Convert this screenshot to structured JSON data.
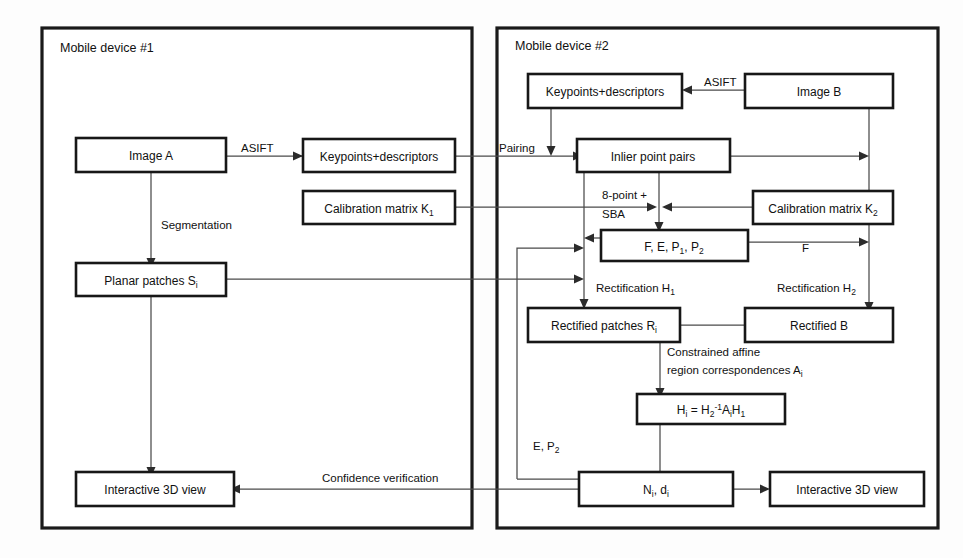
{
  "figure": {
    "type": "flowchart"
  },
  "panels": [
    {
      "id": "device1",
      "title": "Mobile device #1"
    },
    {
      "id": "device2",
      "title": "Mobile device #2"
    }
  ],
  "nodes": {
    "image_a": "Image A",
    "keypoints_a": "Keypoints+descriptors",
    "calib_k1_main": "Calibration matrix K",
    "calib_k1_sub": "1",
    "planar_patches_main": "Planar patches S",
    "planar_patches_sub": "i",
    "interactive_3d_left": "Interactive 3D view",
    "keypoints_b": "Keypoints+descriptors",
    "image_b": "Image B",
    "inlier_pairs": "Inlier point pairs",
    "calib_k2_main": "Calibration matrix K",
    "calib_k2_sub": "2",
    "fep_main_1": "F, E, P",
    "fep_sub_1": "1",
    "fep_main_2": ", P",
    "fep_sub_2": "2",
    "rectified_patches_main": "Rectified patches R",
    "rectified_patches_sub": "i",
    "rectified_b": "Rectified B",
    "homography_h_main": "H",
    "homography_h_sub": "i",
    "homography_eq": " = H",
    "homography_h2_sub": "2",
    "homography_h2_sup": "-1",
    "homography_a": "A",
    "homography_a_sub": "i",
    "homography_h1": "H",
    "homography_h1_sub": "1",
    "nd_main": "N",
    "nd_sub_1": "i",
    "nd_mid": ", d",
    "nd_sub_2": "i",
    "interactive_3d_right": "Interactive 3D view"
  },
  "edge_labels": {
    "asift_left": "ASIFT",
    "asift_right": "ASIFT",
    "segmentation": "Segmentation",
    "pairing": "Pairing",
    "eight_point_line1": "8-point +",
    "eight_point_line2": "SBA",
    "f_label": "F",
    "rectification_h1_main": "Rectification H",
    "rectification_h1_sub": "1",
    "rectification_h2_main": "Rectification H",
    "rectification_h2_sub": "2",
    "constrained_line1": "Constrained affine",
    "constrained_line2_main": "region correspondences A",
    "constrained_line2_sub": "i",
    "e_p2_main": "E, P",
    "e_p2_sub": "2",
    "confidence": "Confidence verification"
  },
  "colors": {
    "panel_border": "#1a1a1a",
    "node_border": "#171717",
    "connector": "#4a4a4a",
    "arrowhead": "#2b2b2b",
    "background": "#fdfdfd",
    "text": "#111111"
  }
}
